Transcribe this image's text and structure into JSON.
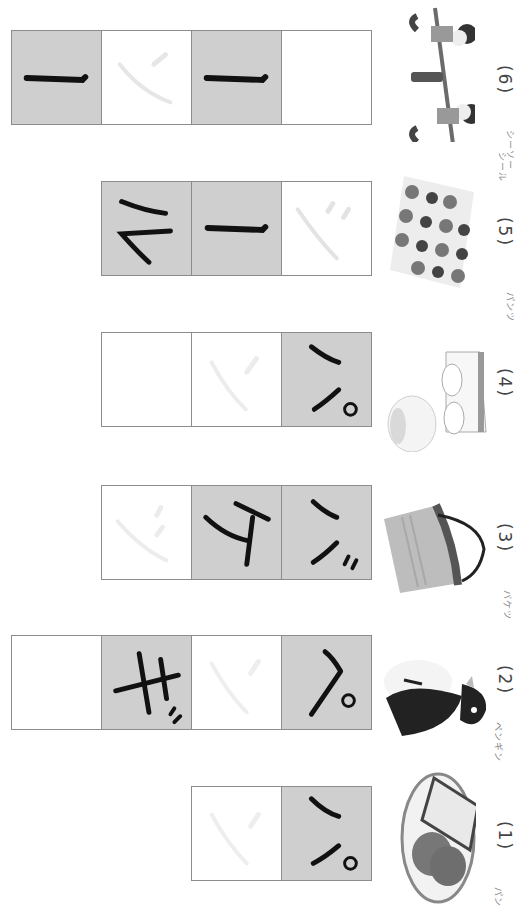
{
  "worksheet": {
    "orientation": "rotated-90-clockwise",
    "problems": [
      {
        "number": "(1)",
        "reading": "パン",
        "picture": "bread-on-plate",
        "cells": [
          {
            "char": "パ",
            "state": "filled-example"
          },
          {
            "char": "ン",
            "state": "faint-trace"
          }
        ]
      },
      {
        "number": "(2)",
        "reading": "ペンギン",
        "picture": "penguin",
        "cells": [
          {
            "char": "ペ",
            "state": "filled-example"
          },
          {
            "char": "ン",
            "state": "faint-trace"
          },
          {
            "char": "ギ",
            "state": "filled-example"
          },
          {
            "char": "",
            "state": "blank"
          }
        ]
      },
      {
        "number": "(3)",
        "reading": "バケツ",
        "picture": "bucket",
        "cells": [
          {
            "char": "バ",
            "state": "filled-example"
          },
          {
            "char": "ケ",
            "state": "filled-example"
          },
          {
            "char": "ツ",
            "state": "faint-trace"
          }
        ]
      },
      {
        "number": "(4)",
        "reading": "パンツ",
        "picture": "underwear",
        "cells": [
          {
            "char": "パ",
            "state": "filled-example"
          },
          {
            "char": "ン",
            "state": "faint-trace"
          },
          {
            "char": "",
            "state": "blank"
          }
        ]
      },
      {
        "number": "(5)",
        "reading": "シール",
        "picture": "sticker-sheet",
        "cells": [
          {
            "char": "シ",
            "state": "faint-trace"
          },
          {
            "char": "ー",
            "state": "filled-example"
          },
          {
            "char": "ル",
            "state": "filled-example"
          }
        ]
      },
      {
        "number": "(6)",
        "reading": "シーソー",
        "picture": "seesaw-with-children",
        "cells": [
          {
            "char": "",
            "state": "blank"
          },
          {
            "char": "ー",
            "state": "filled-example"
          },
          {
            "char": "ソ",
            "state": "faint-trace"
          },
          {
            "char": "ー",
            "state": "filled-example"
          }
        ]
      }
    ]
  },
  "colors": {
    "filled_cell": "#cfcfcf",
    "border": "#8c8c8c",
    "ink": "#111111",
    "trace": "#e6e6e6"
  }
}
